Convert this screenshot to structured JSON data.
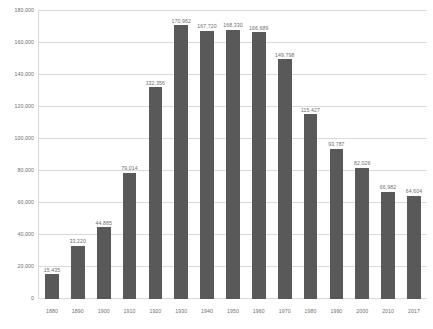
{
  "chart_data": {
    "type": "bar",
    "title": "",
    "subtitle": "",
    "xlabel": "",
    "ylabel": "",
    "categories": [
      "1880",
      "1890",
      "1900",
      "1910",
      "1920",
      "1930",
      "1940",
      "1950",
      "1960",
      "1970",
      "1980",
      "1990",
      "2000",
      "2010",
      "2017"
    ],
    "values": [
      15435,
      33220,
      44885,
      79014,
      132356,
      170962,
      167720,
      168330,
      166689,
      149798,
      115427,
      93787,
      82026,
      66982,
      64604
    ],
    "data_labels": [
      "15,435",
      "33,220",
      "44,885",
      "79,014",
      "132,356",
      "170,962",
      "167,720",
      "168,330",
      "166,689",
      "149,798",
      "115,427",
      "93,787",
      "82,026",
      "66,982",
      "64,604"
    ],
    "ylim": [
      0,
      180000
    ],
    "ytick_values": [
      0,
      20000,
      40000,
      60000,
      80000,
      100000,
      120000,
      140000,
      160000,
      180000
    ],
    "ytick_labels": [
      "0",
      "20,000",
      "40,000",
      "60,000",
      "80,000",
      "100,000",
      "120,000",
      "140,000",
      "160,000",
      "180,000"
    ],
    "grid": true,
    "legend": false,
    "legend_position": "none",
    "series": [
      {
        "name": "",
        "values": [
          15435,
          33220,
          44885,
          79014,
          132356,
          170962,
          167720,
          168330,
          166689,
          149798,
          115427,
          93787,
          82026,
          66982,
          64604
        ]
      }
    ],
    "colors": {
      "bar": "#595959",
      "gridline": "#d9d9d9",
      "tick_text": "#6e6e6e",
      "background": "#ffffff"
    }
  }
}
